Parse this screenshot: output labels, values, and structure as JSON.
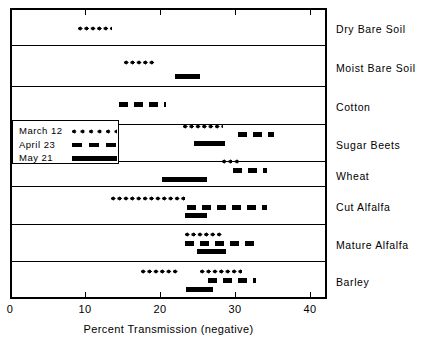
{
  "chart_data": {
    "type": "bar",
    "title": "",
    "xlabel": "Percent Transmission (negative)",
    "ylabel": "",
    "xlim": [
      0,
      42.5
    ],
    "xticks": [
      0,
      10,
      20,
      30,
      40
    ],
    "xticklabels": [
      "0",
      "10",
      "20",
      "30",
      "40"
    ],
    "grid": false,
    "legend_position": "inside-left",
    "legend": [
      {
        "name": "March 12",
        "style": "dotted"
      },
      {
        "name": "April 23",
        "style": "dashed"
      },
      {
        "name": "May 21",
        "style": "solid"
      }
    ],
    "categories": [
      "Dry Bare Soil",
      "Moist Bare Soil",
      "Cotton",
      "Sugar Beets",
      "Wheat",
      "Cut Alfalfa",
      "Mature Alfalfa",
      "Barley"
    ],
    "series": [
      {
        "name": "March 12",
        "style": "dotted",
        "ranges": [
          {
            "category": "Dry Bare Soil",
            "start": 8.8,
            "end": 13.2
          },
          {
            "category": "Moist Bare Soil",
            "start": 14.8,
            "end": 18.8
          },
          {
            "category": "Cotton",
            "start": null,
            "end": null
          },
          {
            "category": "Sugar Beets",
            "start": 22.4,
            "end": 27.5
          },
          {
            "category": "Wheat",
            "start": 27.5,
            "end": 30.1
          },
          {
            "category": "Cut Alfalfa",
            "start": 13.5,
            "end": 23.3
          },
          {
            "category": "Mature Alfalfa",
            "start": 23.3,
            "end": 28.2
          },
          {
            "category": "Barley",
            "start": 17.4,
            "end": 30.9
          }
        ]
      },
      {
        "name": "April 23",
        "style": "dashed",
        "ranges": [
          {
            "category": "Dry Bare Soil",
            "start": null,
            "end": null
          },
          {
            "category": "Moist Bare Soil",
            "start": null,
            "end": null
          },
          {
            "category": "Cotton",
            "start": 14.1,
            "end": 20.1
          },
          {
            "category": "Sugar Beets",
            "start": 29.4,
            "end": 34.2
          },
          {
            "category": "Wheat",
            "start": 29.7,
            "end": 34.2
          },
          {
            "category": "Cut Alfalfa",
            "start": 23.6,
            "end": 34.2
          },
          {
            "category": "Mature Alfalfa",
            "start": 23.3,
            "end": 33.3
          },
          {
            "category": "Barley",
            "start": 26.4,
            "end": 32.8
          }
        ]
      },
      {
        "name": "May 21",
        "style": "solid",
        "ranges": [
          {
            "category": "Dry Bare Soil",
            "start": null,
            "end": null
          },
          {
            "category": "Moist Bare Soil",
            "start": 21.3,
            "end": 24.5
          },
          {
            "category": "Cotton",
            "start": null,
            "end": null
          },
          {
            "category": "Sugar Beets",
            "start": 24.5,
            "end": 28.6
          },
          {
            "category": "Wheat",
            "start": 20.3,
            "end": 26.2
          },
          {
            "category": "Cut Alfalfa",
            "start": 23.3,
            "end": 26.2
          },
          {
            "category": "Mature Alfalfa",
            "start": 24.9,
            "end": 28.8
          },
          {
            "category": "Barley",
            "start": 23.5,
            "end": 27.1
          }
        ]
      }
    ]
  },
  "axis": {
    "tick_labels": [
      "0",
      "10",
      "20",
      "30",
      "40"
    ],
    "title": "Percent Transmission (negative)"
  },
  "rows": [
    {
      "label": "Dry Bare Soil"
    },
    {
      "label": "Moist Bare Soil"
    },
    {
      "label": "Cotton"
    },
    {
      "label": "Sugar Beets"
    },
    {
      "label": "Wheat"
    },
    {
      "label": "Cut Alfalfa"
    },
    {
      "label": "Mature Alfalfa"
    },
    {
      "label": "Barley"
    }
  ],
  "legend": {
    "entries": [
      {
        "label": "March 12",
        "style": "dotted"
      },
      {
        "label": "April 23",
        "style": "dashed"
      },
      {
        "label": "May 21",
        "style": "solid"
      }
    ]
  },
  "layout": {
    "rows_px": [
      {
        "top": 8,
        "bottom": 45
      },
      {
        "top": 45,
        "bottom": 86
      },
      {
        "top": 86,
        "bottom": 124
      },
      {
        "top": 124,
        "bottom": 161
      },
      {
        "top": 161,
        "bottom": 186
      },
      {
        "top": 186,
        "bottom": 224
      },
      {
        "top": 224,
        "bottom": 261
      },
      {
        "top": 261,
        "bottom": 299
      }
    ],
    "x0_px": 10,
    "x_per_unit_px": 7.5,
    "marks": [
      {
        "row": 0,
        "style": "dotted",
        "x1": 78,
        "x2": 112,
        "y": 26
      },
      {
        "row": 1,
        "style": "dotted",
        "x1": 124,
        "x2": 155,
        "y": 60
      },
      {
        "row": 1,
        "style": "solid",
        "x1": 175,
        "x2": 200,
        "y": 74
      },
      {
        "row": 2,
        "style": "dashed",
        "x1": 119,
        "x2": 166,
        "y": 102
      },
      {
        "row": 3,
        "style": "dotted",
        "x1": 183,
        "x2": 223,
        "y": 124
      },
      {
        "row": 3,
        "style": "dashed",
        "x1": 238,
        "x2": 274,
        "y": 132
      },
      {
        "row": 3,
        "style": "solid",
        "x1": 194,
        "x2": 225,
        "y": 141
      },
      {
        "row": 4,
        "style": "dotted",
        "x1": 222,
        "x2": 241,
        "y": 159
      },
      {
        "row": 4,
        "style": "dashed",
        "x1": 233,
        "x2": 267,
        "y": 168
      },
      {
        "row": 4,
        "style": "solid",
        "x1": 162,
        "x2": 207,
        "y": 177
      },
      {
        "row": 5,
        "style": "dotted",
        "x1": 111,
        "x2": 185,
        "y": 196
      },
      {
        "row": 5,
        "style": "dashed",
        "x1": 187,
        "x2": 267,
        "y": 205
      },
      {
        "row": 5,
        "style": "solid",
        "x1": 185,
        "x2": 207,
        "y": 213
      },
      {
        "row": 6,
        "style": "dotted",
        "x1": 185,
        "x2": 222,
        "y": 232
      },
      {
        "row": 6,
        "style": "dashed",
        "x1": 185,
        "x2": 260,
        "y": 241
      },
      {
        "row": 6,
        "style": "solid",
        "x1": 197,
        "x2": 226,
        "y": 249
      },
      {
        "row": 7,
        "style": "dotted",
        "x1": 141,
        "x2": 179,
        "y": 269
      },
      {
        "row": 7,
        "style": "dotted",
        "x1": 200,
        "x2": 242,
        "y": 269
      },
      {
        "row": 7,
        "style": "dashed",
        "x1": 208,
        "x2": 256,
        "y": 278
      },
      {
        "row": 7,
        "style": "solid",
        "x1": 186,
        "x2": 213,
        "y": 287
      }
    ]
  }
}
